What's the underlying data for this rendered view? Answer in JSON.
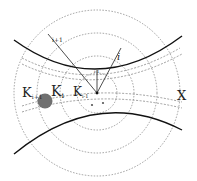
{
  "diagram": {
    "labels": {
      "k_i_plus_1": "K",
      "k_i_plus_1_sub": "i+1",
      "k_i": "K",
      "k_i_sub": "i",
      "k_i_minus_1": "K",
      "k_i_minus_1_sub": "i-1",
      "radius_i_plus_1": "i+1",
      "radius_i": "i",
      "radius_i_minus_1": "i-1",
      "x_label": "X"
    },
    "colors": {
      "stroke": "#111111",
      "dashed": "#777777",
      "dot": "#707070"
    }
  }
}
